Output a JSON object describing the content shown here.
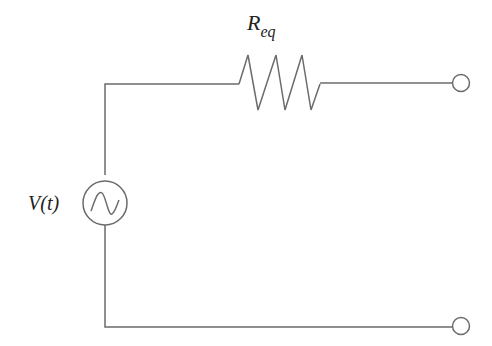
{
  "diagram": {
    "type": "circuit",
    "title": "",
    "stroke_color": "#6b6b6b",
    "components": [
      {
        "id": "source",
        "kind": "ac-voltage-source",
        "label": "V(t)"
      },
      {
        "id": "resistor",
        "kind": "resistor",
        "label_main": "R",
        "label_sub": "eq"
      },
      {
        "id": "terminal-top",
        "kind": "open-terminal"
      },
      {
        "id": "terminal-bottom",
        "kind": "open-terminal"
      }
    ],
    "source_label": "V(t)",
    "resistor_label": {
      "main": "R",
      "sub": "eq"
    }
  }
}
